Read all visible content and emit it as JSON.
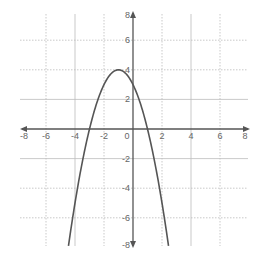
{
  "chart_data": {
    "type": "line",
    "title": "",
    "xlabel": "",
    "ylabel": "",
    "xlim": [
      -8,
      8
    ],
    "ylim": [
      -8,
      8
    ],
    "grid": true,
    "x_ticks": [
      -8,
      -6,
      -4,
      -2,
      0,
      2,
      4,
      6,
      8
    ],
    "y_ticks": [
      -8,
      -6,
      -4,
      -2,
      2,
      4,
      6,
      8
    ],
    "x_tick_labels": [
      "-8",
      "-6",
      "-4",
      "-2",
      "0",
      "2",
      "4",
      "6",
      "8"
    ],
    "y_tick_labels": [
      "-8",
      "-6",
      "-4",
      "-2",
      "2",
      "4",
      "6",
      "8"
    ],
    "series": [
      {
        "name": "parabola",
        "equation": "y = -(x + 1)^2 + 4",
        "vertex": [
          -1,
          4
        ],
        "x_intercepts": [
          -3,
          1
        ],
        "y_intercept": 3,
        "x": [
          -4.4,
          -4,
          -3.5,
          -3,
          -2.5,
          -2,
          -1.5,
          -1,
          -0.5,
          0,
          0.5,
          1,
          1.5,
          2,
          2.4
        ],
        "values": [
          -7.56,
          -5,
          -2.25,
          0,
          1.75,
          3,
          3.75,
          4,
          3.75,
          3,
          1.75,
          0,
          -2.25,
          -5,
          -7.56
        ]
      }
    ]
  },
  "colors": {
    "curve": "#555555",
    "axis": "#555555",
    "grid": "#bbbbbb",
    "tick_label": "#666666"
  }
}
